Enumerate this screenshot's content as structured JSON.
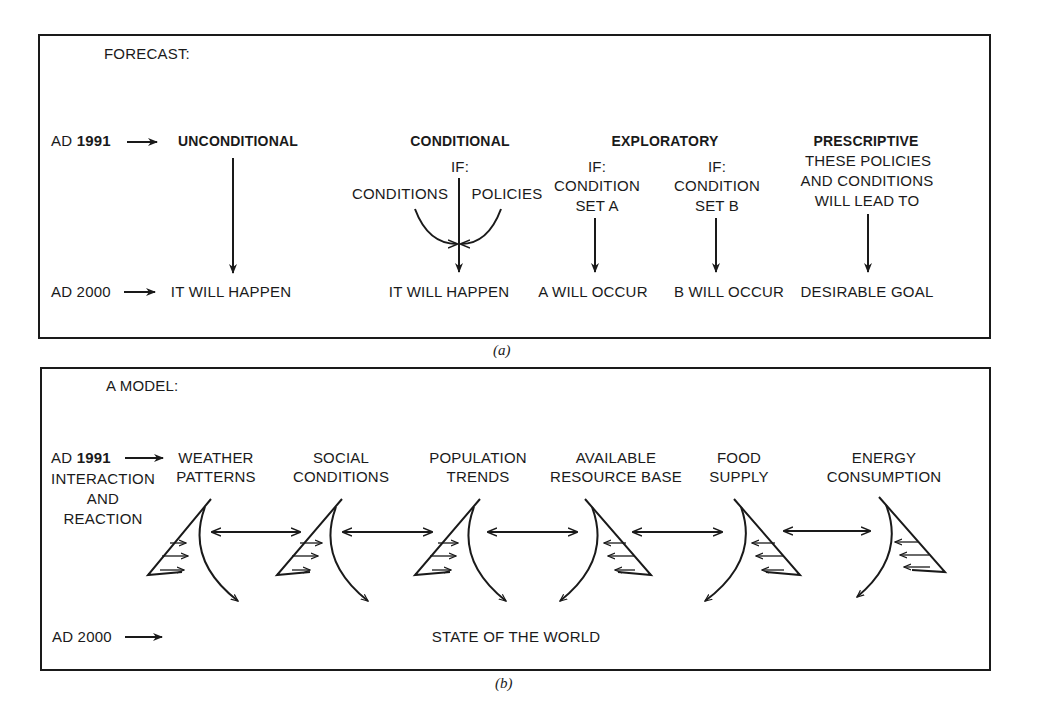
{
  "panel_a": {
    "heading": "FORECAST:",
    "caption": "(a)",
    "row_start": {
      "prefix": "AD",
      "year": "1991"
    },
    "row_end": {
      "label": "AD 2000"
    },
    "columns": [
      {
        "title": "UNCONDITIONAL",
        "condition_lines": [],
        "outcome": "IT WILL HAPPEN"
      },
      {
        "title": "CONDITIONAL",
        "if_label": "IF:",
        "left_input": "CONDITIONS",
        "right_input": "POLICIES",
        "outcome": "IT WILL HAPPEN"
      },
      {
        "title": "EXPLORATORY",
        "sub": [
          {
            "if_label": "IF:",
            "line1": "CONDITION",
            "line2": "SET A",
            "outcome": "A WILL OCCUR"
          },
          {
            "if_label": "IF:",
            "line1": "CONDITION",
            "line2": "SET B",
            "outcome": "B WILL OCCUR"
          }
        ]
      },
      {
        "title": "PRESCRIPTIVE",
        "lines": [
          "THESE POLICIES",
          "AND CONDITIONS",
          "WILL LEAD TO"
        ],
        "outcome": "DESIRABLE GOAL"
      }
    ]
  },
  "panel_b": {
    "heading": "A MODEL:",
    "caption": "(b)",
    "row_start": {
      "prefix": "AD",
      "year": "1991"
    },
    "row_end": {
      "label": "AD 2000"
    },
    "side_label": [
      "INTERACTION",
      "AND",
      "REACTION"
    ],
    "factors": [
      {
        "line1": "WEATHER",
        "line2": "PATTERNS"
      },
      {
        "line1": "SOCIAL",
        "line2": "CONDITIONS"
      },
      {
        "line1": "POPULATION",
        "line2": "TRENDS"
      },
      {
        "line1": "AVAILABLE",
        "line2": "RESOURCE BASE"
      },
      {
        "line1": "FOOD",
        "line2": "SUPPLY"
      },
      {
        "line1": "ENERGY",
        "line2": "CONSUMPTION"
      }
    ],
    "outcome": "STATE OF THE WORLD"
  },
  "colors": {
    "ink": "#1a1a1a",
    "background": "#ffffff"
  }
}
